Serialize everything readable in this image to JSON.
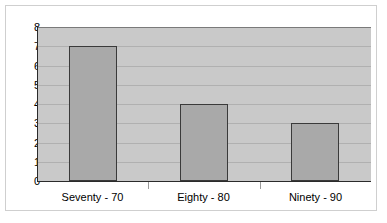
{
  "chart_data": {
    "type": "bar",
    "title": "",
    "subtitle": "",
    "xlabel": "",
    "ylabel": "",
    "categories": [
      "Seventy - 70",
      "Eighty - 80",
      "Ninety - 90"
    ],
    "values": [
      7,
      4,
      3
    ],
    "ylim": [
      0,
      8
    ],
    "ytick_labels": [
      "8",
      "7",
      "6",
      "5",
      "4",
      "3",
      "2",
      "1",
      "0"
    ],
    "ytick_values": [
      8,
      7,
      6,
      5,
      4,
      3,
      2,
      1,
      0
    ],
    "grid": true,
    "grid_axis": "y",
    "legend": false,
    "legend_position": "none",
    "annotations": []
  },
  "style": {
    "plot_background": "#c9c9c9",
    "gridline_color": "#b0b0b0",
    "bar_fill": "#a9a9a9",
    "bar_border": "#3a3a3a",
    "axis_color": "#2b2b2b",
    "frame_border": "#cfcfcf",
    "page_background": "#ffffff",
    "text_color": "#000000"
  }
}
